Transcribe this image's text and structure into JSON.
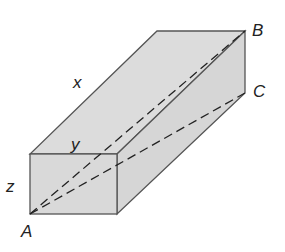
{
  "figure": {
    "type": "rectangular-prism",
    "fill_color": "#dcdcdc",
    "edge_color": "#555555",
    "dash_color": "#222222",
    "labels": {
      "x": "x",
      "y": "y",
      "z": "z",
      "A": "A",
      "B": "B",
      "C": "C"
    },
    "diagonals": [
      {
        "from": "A",
        "to": "B",
        "style": "dashed"
      },
      {
        "from": "A",
        "to": "C",
        "style": "dashed"
      }
    ]
  }
}
